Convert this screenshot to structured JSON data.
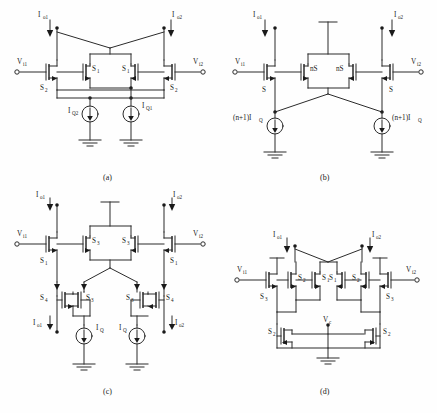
{
  "figure": {
    "background": "#fefefe",
    "ink": "#1a1a1a",
    "panels": [
      {
        "id": "a",
        "caption": "(a)",
        "labels": {
          "in_left": "V",
          "in_left_sub": "i1",
          "in_right": "V",
          "in_right_sub": "i2",
          "out_left": "I",
          "out_left_sub": "o1",
          "out_right": "I",
          "out_right_sub": "o2",
          "src_left": "I",
          "src_left_sub": "Q2",
          "src_right": "I",
          "src_right_sub": "Q1",
          "dev_mid_left": "S",
          "dev_mid_left_sub": "1",
          "dev_mid_right": "S",
          "dev_mid_right_sub": "1",
          "dev_out_left": "S",
          "dev_out_left_sub": "2",
          "dev_out_right": "S",
          "dev_out_right_sub": "2"
        }
      },
      {
        "id": "b",
        "caption": "(b)",
        "labels": {
          "in_left": "V",
          "in_left_sub": "i1",
          "in_right": "V",
          "in_right_sub": "i2",
          "out_left": "I",
          "out_left_sub": "o1",
          "out_right": "I",
          "out_right_sub": "o2",
          "src_left": "(n+1)I",
          "src_left_sub": "Q",
          "src_right": "(n+1)I",
          "src_right_sub": "Q",
          "dev_mid_left": "nS",
          "dev_mid_left_sub": "",
          "dev_mid_right": "nS",
          "dev_mid_right_sub": "",
          "dev_out_left": "S",
          "dev_out_left_sub": "",
          "dev_out_right": "S",
          "dev_out_right_sub": ""
        }
      },
      {
        "id": "c",
        "caption": "(c)",
        "labels": {
          "in_left": "V",
          "in_left_sub": "i1",
          "in_right": "V",
          "in_right_sub": "i2",
          "top_left": "I",
          "top_left_sub": "o1",
          "top_right": "I",
          "top_right_sub": "o2",
          "out_left": "I",
          "out_left_sub": "o1",
          "out_right": "I",
          "out_right_sub": "o2",
          "src_left": "I",
          "src_left_sub": "Q",
          "src_right": "I",
          "src_right_sub": "Q",
          "dev_mid_left": "S",
          "dev_mid_left_sub": "3",
          "dev_mid_right": "S",
          "dev_mid_right_sub": "3",
          "dev_in_left": "S",
          "dev_in_left_sub": "1",
          "dev_in_right": "S",
          "dev_in_right_sub": "1",
          "dev_bot_outer_left": "S",
          "dev_bot_outer_left_sub": "4",
          "dev_bot_inner_left": "S",
          "dev_bot_inner_left_sub": "3",
          "dev_bot_inner_right": "S",
          "dev_bot_inner_right_sub": "3",
          "dev_bot_outer_right": "S",
          "dev_bot_outer_right_sub": "4"
        }
      },
      {
        "id": "d",
        "caption": "(d)",
        "labels": {
          "in_left": "V",
          "in_left_sub": "i1",
          "in_right": "V",
          "in_right_sub": "i2",
          "out_left": "I",
          "out_left_sub": "o1",
          "out_right": "I",
          "out_right_sub": "o2",
          "ctrl": "V",
          "ctrl_sub": "c",
          "dev_core_1": "S",
          "dev_core_1_sub": "2",
          "dev_core_2": "S",
          "dev_core_2_sub": "1",
          "dev_core_3": "S",
          "dev_core_3_sub": "1",
          "dev_core_4": "S",
          "dev_core_4_sub": "2",
          "dev_in_left": "S",
          "dev_in_left_sub": "3",
          "dev_in_right": "S",
          "dev_in_right_sub": "3",
          "dev_bot_left": "S",
          "dev_bot_left_sub": "2",
          "dev_bot_right": "S",
          "dev_bot_right_sub": "2"
        }
      }
    ]
  }
}
